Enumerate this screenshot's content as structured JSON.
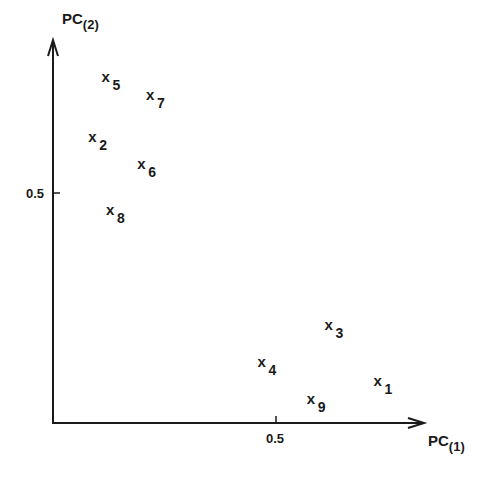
{
  "chart_data": {
    "type": "scatter",
    "title": "",
    "xlabel": "PC(1)",
    "ylabel": "PC(2)",
    "xlabel_main": "PC",
    "xlabel_sub": "(1)",
    "ylabel_main": "PC",
    "ylabel_sub": "(2)",
    "xlim": [
      0,
      0.83
    ],
    "ylim": [
      0,
      0.83
    ],
    "x_ticks": [
      {
        "value": 0.5,
        "label": "0.5"
      }
    ],
    "y_ticks": [
      {
        "value": 0.5,
        "label": "0.5"
      }
    ],
    "grid": false,
    "legend": null,
    "marker": "x",
    "points": [
      {
        "label": "1",
        "x": 0.73,
        "y": 0.09
      },
      {
        "label": "2",
        "x": 0.09,
        "y": 0.62
      },
      {
        "label": "3",
        "x": 0.62,
        "y": 0.21
      },
      {
        "label": "4",
        "x": 0.47,
        "y": 0.13
      },
      {
        "label": "5",
        "x": 0.12,
        "y": 0.75
      },
      {
        "label": "6",
        "x": 0.2,
        "y": 0.56
      },
      {
        "label": "7",
        "x": 0.22,
        "y": 0.71
      },
      {
        "label": "8",
        "x": 0.13,
        "y": 0.46
      },
      {
        "label": "9",
        "x": 0.58,
        "y": 0.05
      }
    ]
  }
}
